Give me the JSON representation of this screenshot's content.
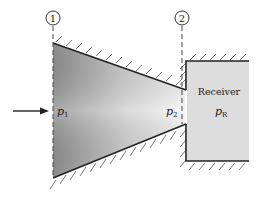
{
  "diagram": {
    "stations": [
      {
        "id": "1",
        "label": "1"
      },
      {
        "id": "2",
        "label": "2"
      }
    ],
    "labels": {
      "p1_base": "p",
      "p1_sub": "1",
      "p2_base": "p",
      "p2_sub": "2",
      "receiver": "Receiver",
      "pR_base": "p",
      "pR_sub": "R"
    },
    "colors": {
      "line": "#222222",
      "nozzle_gradient_dark": "#8a8a8a",
      "nozzle_gradient_light": "#f2f2f2",
      "receiver_fill": "#dcdcdc",
      "hatch": "#555555"
    }
  }
}
